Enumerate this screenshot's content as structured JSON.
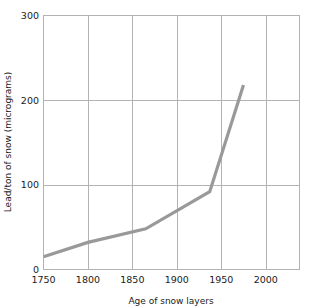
{
  "chart_data": {
    "type": "line",
    "title": "",
    "xlabel": "Age of snow layers",
    "ylabel": "Lead/ton of snow (micrograms)",
    "xlim": [
      1750,
      2038
    ],
    "ylim": [
      0,
      300
    ],
    "xticks": [
      1750,
      1800,
      1850,
      1900,
      1950,
      2000
    ],
    "xtick_labels": [
      "1750",
      "1800",
      "1850",
      "1900",
      "1950",
      "2000"
    ],
    "yticks": [
      0,
      100,
      200,
      300
    ],
    "ytick_labels": [
      "0",
      "100",
      "200",
      "300"
    ],
    "grid": true,
    "legend": "none",
    "series": [
      {
        "name": "Lead in snow",
        "color": "#999999",
        "x": [
          1750,
          1800,
          1865,
          1937,
          1975
        ],
        "values": [
          15,
          32,
          48,
          92,
          218
        ]
      }
    ]
  },
  "colors": {
    "line": "#999999",
    "grid": "#b3b3b3",
    "frame": "#b3b3b3",
    "text": "#1a1a1a",
    "background": "#ffffff"
  }
}
